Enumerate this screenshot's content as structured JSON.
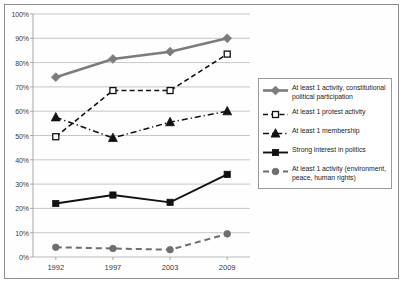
{
  "chart_data": {
    "type": "line",
    "title": "",
    "xlabel": "",
    "ylabel": "",
    "categories": [
      "1992",
      "1997",
      "2003",
      "2009"
    ],
    "x": [
      1992,
      1997,
      2003,
      2009
    ],
    "ylim": [
      0,
      100
    ],
    "ytick_labels": [
      "0%",
      "10%",
      "20%",
      "30%",
      "40%",
      "50%",
      "60%",
      "70%",
      "80%",
      "90%",
      "100%"
    ],
    "ytick_values": [
      0,
      10,
      20,
      30,
      40,
      50,
      60,
      70,
      80,
      90,
      100
    ],
    "grid": "horizontal",
    "legend_position": "right",
    "series": [
      {
        "name": "At least 1 activity, constitutional political participation",
        "values": [
          74,
          81.5,
          84.5,
          90
        ],
        "color": "#7c7c7c",
        "marker": "diamond",
        "marker_fill": "#7c7c7c",
        "line_style": "solid",
        "line_width": 2.6
      },
      {
        "name": "At least 1 protest activity",
        "values": [
          49.5,
          68.5,
          68.5,
          83.5
        ],
        "color": "#111111",
        "marker": "square-open",
        "marker_fill": "#ffffff",
        "line_style": "dashed",
        "line_width": 1.6
      },
      {
        "name": "At least 1 membership",
        "values": [
          57.5,
          49,
          55.5,
          60
        ],
        "color": "#111111",
        "marker": "triangle",
        "marker_fill": "#111111",
        "line_style": "dash-dot",
        "line_width": 1.5
      },
      {
        "name": "Strong interest in politics",
        "values": [
          22,
          25.5,
          22.5,
          34
        ],
        "color": "#111111",
        "marker": "square",
        "marker_fill": "#111111",
        "line_style": "solid",
        "line_width": 1.9
      },
      {
        "name": "At least 1 activity (environment, peace, human rights)",
        "values": [
          4,
          3.5,
          3,
          9.5
        ],
        "color": "#6e6e6e",
        "marker": "circle",
        "marker_fill": "#6e6e6e",
        "line_style": "dashed",
        "line_width": 2.0
      }
    ]
  },
  "legend": {
    "items": [
      {
        "label": "At least 1 activity, constitutional political participation"
      },
      {
        "label": "At least 1 protest activity"
      },
      {
        "label": "At least 1 membership"
      },
      {
        "label": "Strong interest in politics"
      },
      {
        "label": "At least 1 activity (environment, peace, human rights)"
      }
    ]
  },
  "axes": {
    "y_axis_color": "#a8a8a8",
    "x_axis_color": "#a8a8a8",
    "grid_color": "#b9b9b9"
  }
}
